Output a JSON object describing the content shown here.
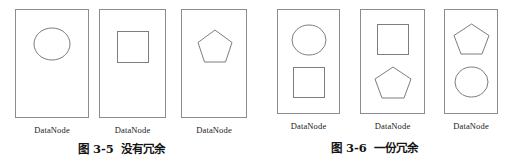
{
  "figure": {
    "background_color": "#ffffff",
    "line_color": "#8c8c8c",
    "shape_stroke_color": "#7d7d7d",
    "text_color": "#141414"
  },
  "groups": [
    {
      "id": "no-redundancy",
      "caption_number": "图 3-5",
      "caption_text": "没有冗余",
      "nodes": [
        {
          "label": "DataNode",
          "shapes": [
            "circle"
          ]
        },
        {
          "label": "DataNode",
          "shapes": [
            "square"
          ]
        },
        {
          "label": "DataNode",
          "shapes": [
            "pentagon"
          ]
        }
      ]
    },
    {
      "id": "one-replica",
      "caption_number": "图 3-6",
      "caption_text": "一份冗余",
      "nodes": [
        {
          "label": "DataNode",
          "shapes": [
            "circle",
            "square"
          ]
        },
        {
          "label": "DataNode",
          "shapes": [
            "square",
            "pentagon"
          ]
        },
        {
          "label": "DataNode",
          "shapes": [
            "pentagon",
            "circle"
          ]
        }
      ]
    }
  ]
}
